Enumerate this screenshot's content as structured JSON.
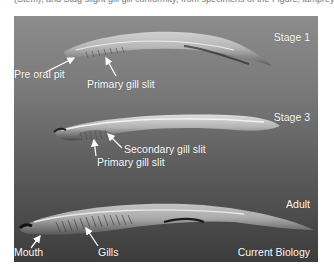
{
  "caption_fragment": "(Stem), and Stag slight gill gill conformity, from specimens of the Figure, lamprey l",
  "figure": {
    "credit": "Current Biology",
    "background_gradient": [
      "#8c8c8c",
      "#3c3c3c"
    ],
    "panels": [
      {
        "stage": "Stage 1",
        "annotations": [
          "Pre oral pit",
          "Primary gill slit"
        ]
      },
      {
        "stage": "Stage 3",
        "annotations": [
          "Secondary gill slit",
          "Primary gill slit"
        ]
      },
      {
        "stage": "Adult",
        "annotations": [
          "Mouth",
          "Gills"
        ]
      }
    ]
  }
}
